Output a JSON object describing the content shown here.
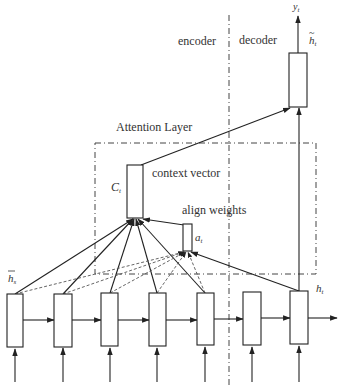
{
  "diagram": {
    "title": "Attention Layer",
    "regions": {
      "encoder_label": "encoder",
      "decoder_label": "decoder"
    },
    "labels": {
      "context_vector": "context vector",
      "align_weights": "align weights",
      "context_symbol": "C",
      "context_sub": "t",
      "align_symbol": "a",
      "align_sub": "t",
      "output_symbol": "y",
      "output_sub": "t",
      "attn_hidden_symbol": "h",
      "attn_hidden_sub": "t",
      "source_hidden_symbol": "h",
      "source_hidden_sub": "s",
      "target_hidden_symbol": "h",
      "target_hidden_sub": "t"
    },
    "encoder_cells": 5,
    "decoder_cells": 2,
    "colors": {
      "stroke": "#333333",
      "background": "#ffffff"
    }
  }
}
